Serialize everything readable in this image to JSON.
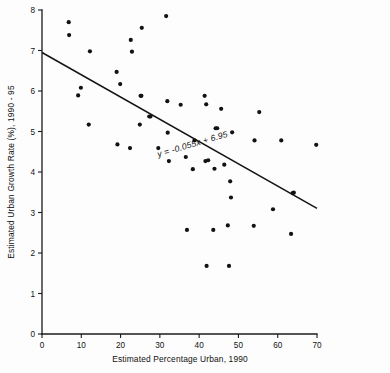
{
  "chart_data": {
    "type": "scatter",
    "title": "",
    "xlabel": "Estimated Percentage Urban, 1990",
    "ylabel": "Estimated Urban Growth Rate (%), 1990 - 95",
    "xlim": [
      0,
      70
    ],
    "ylim": [
      0,
      8
    ],
    "xticks": [
      0,
      10,
      20,
      30,
      40,
      50,
      60,
      70
    ],
    "yticks": [
      0,
      1,
      2,
      3,
      4,
      5,
      6,
      7,
      8
    ],
    "xtick_labels": [
      "0",
      "10",
      "20",
      "30",
      "40",
      "50",
      "60",
      "70"
    ],
    "ytick_labels": [
      "0",
      "1",
      "2",
      "3",
      "4",
      "5",
      "6",
      "7",
      "8"
    ],
    "grid": false,
    "legend": false,
    "marker": "filled-circle",
    "marker_color": "#121212",
    "annotation": {
      "text": "y = -0.055x + 6.95",
      "x": 38.5,
      "y": 4.62,
      "rotation": -16.5
    },
    "trendline": {
      "type": "linear",
      "slope": -0.055,
      "intercept": 6.95,
      "equation": "y = -0.055x + 6.95",
      "x_start": 0,
      "x_end": 70,
      "color": "#141414"
    },
    "points": [
      {
        "x": 6.8,
        "y": 7.7
      },
      {
        "x": 6.9,
        "y": 7.38
      },
      {
        "x": 9.2,
        "y": 5.89
      },
      {
        "x": 9.9,
        "y": 6.08
      },
      {
        "x": 11.9,
        "y": 5.17
      },
      {
        "x": 12.2,
        "y": 6.98
      },
      {
        "x": 19.0,
        "y": 6.47
      },
      {
        "x": 19.2,
        "y": 4.68
      },
      {
        "x": 19.9,
        "y": 6.17
      },
      {
        "x": 22.4,
        "y": 4.59
      },
      {
        "x": 22.6,
        "y": 7.26
      },
      {
        "x": 22.9,
        "y": 6.97
      },
      {
        "x": 24.9,
        "y": 5.17
      },
      {
        "x": 25.1,
        "y": 5.88
      },
      {
        "x": 25.3,
        "y": 5.88
      },
      {
        "x": 25.4,
        "y": 7.56
      },
      {
        "x": 27.3,
        "y": 5.37
      },
      {
        "x": 27.6,
        "y": 5.37
      },
      {
        "x": 29.6,
        "y": 4.59
      },
      {
        "x": 31.6,
        "y": 7.85
      },
      {
        "x": 31.9,
        "y": 5.75
      },
      {
        "x": 32.0,
        "y": 4.97
      },
      {
        "x": 32.3,
        "y": 4.27
      },
      {
        "x": 35.3,
        "y": 5.66
      },
      {
        "x": 36.6,
        "y": 4.37
      },
      {
        "x": 36.9,
        "y": 2.57
      },
      {
        "x": 38.4,
        "y": 4.07
      },
      {
        "x": 38.8,
        "y": 4.78
      },
      {
        "x": 41.4,
        "y": 5.88
      },
      {
        "x": 41.6,
        "y": 4.27
      },
      {
        "x": 41.8,
        "y": 5.67
      },
      {
        "x": 41.9,
        "y": 1.68
      },
      {
        "x": 42.3,
        "y": 4.29
      },
      {
        "x": 43.6,
        "y": 2.57
      },
      {
        "x": 43.9,
        "y": 4.08
      },
      {
        "x": 44.2,
        "y": 5.08
      },
      {
        "x": 44.6,
        "y": 5.08
      },
      {
        "x": 45.6,
        "y": 5.56
      },
      {
        "x": 46.4,
        "y": 4.18
      },
      {
        "x": 47.3,
        "y": 2.68
      },
      {
        "x": 47.6,
        "y": 1.68
      },
      {
        "x": 47.9,
        "y": 3.77
      },
      {
        "x": 48.1,
        "y": 3.37
      },
      {
        "x": 48.4,
        "y": 4.98
      },
      {
        "x": 53.9,
        "y": 2.67
      },
      {
        "x": 54.1,
        "y": 4.78
      },
      {
        "x": 55.3,
        "y": 5.48
      },
      {
        "x": 58.8,
        "y": 3.08
      },
      {
        "x": 60.9,
        "y": 4.78
      },
      {
        "x": 63.4,
        "y": 2.47
      },
      {
        "x": 63.8,
        "y": 3.48
      },
      {
        "x": 64.1,
        "y": 3.49
      },
      {
        "x": 69.8,
        "y": 4.67
      }
    ]
  }
}
